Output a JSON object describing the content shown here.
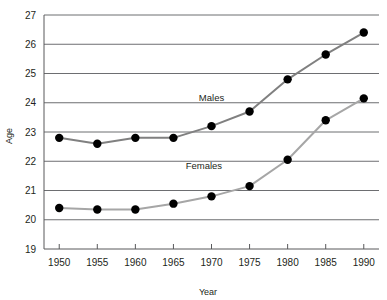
{
  "chart_data": {
    "type": "line",
    "title": "",
    "subtitle": "",
    "xlabel": "Year",
    "ylabel": "Age",
    "x": [
      1950,
      1955,
      1960,
      1965,
      1970,
      1975,
      1980,
      1985,
      1990
    ],
    "xticklabels": [
      "1950",
      "1955",
      "1960",
      "1965",
      "1970",
      "1975",
      "1980",
      "1985",
      "1990"
    ],
    "yticklabels": [
      "19",
      "20",
      "21",
      "22",
      "23",
      "24",
      "25",
      "26",
      "27"
    ],
    "xlim": [
      1948,
      1992
    ],
    "ylim": [
      19,
      27
    ],
    "yticks": [
      19,
      20,
      21,
      22,
      23,
      24,
      25,
      26,
      27
    ],
    "grid": "horizontal",
    "legend": "inline-labels",
    "series": [
      {
        "name": "Males",
        "label": "Males",
        "color": "#808080",
        "marker_color": "#000000",
        "values": [
          22.8,
          22.6,
          22.8,
          22.8,
          23.2,
          23.7,
          24.8,
          25.65,
          26.4
        ]
      },
      {
        "name": "Females",
        "label": "Females",
        "color": "#a6a6a6",
        "marker_color": "#000000",
        "values": [
          20.4,
          20.35,
          20.35,
          20.55,
          20.8,
          21.15,
          22.05,
          23.4,
          24.15
        ]
      }
    ],
    "annotations": [
      {
        "text": "Males",
        "x": 1970,
        "y": 24.05
      },
      {
        "text": "Females",
        "x": 1969,
        "y": 21.72
      }
    ],
    "style": {
      "grid_color": "#6d6e71",
      "axis_color": "#58595b",
      "background": "#ffffff",
      "marker_size": 4.2,
      "line_width": 2
    }
  }
}
